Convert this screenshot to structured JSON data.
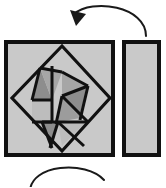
{
  "figure": {
    "canvas": {
      "width": 166,
      "height": 187
    },
    "colors": {
      "background": "#ffffff",
      "outline": "#111111",
      "fill_light": "#c9c9c9",
      "fill_medium": "#a8a8a8",
      "fill_dark": "#8d8d8d",
      "arrow": "#1a1a1a"
    }
  },
  "shapes": {
    "square_piece": {
      "name": "dissected-square",
      "label": "square",
      "x": 6,
      "y": 42,
      "width": 107,
      "height": 113,
      "fill": "#c9c9c9",
      "stroke": "#111111",
      "stroke_width": 4
    },
    "rectangle_piece": {
      "name": "plain-rectangle",
      "label": "rectangle",
      "x": 124,
      "y": 42,
      "width": 35,
      "height": 113,
      "fill": "#c9c9c9",
      "stroke": "#111111",
      "stroke_width": 4
    },
    "inner_diamond": {
      "label": "inscribed diamond",
      "points": "62,46 110,98 62,151 12,98",
      "fill": "#c9c9c9",
      "stroke": "#111111",
      "stroke_width": 3.2
    },
    "pieces": [
      {
        "id": "piece-1",
        "label": "dark triangle upper-left",
        "points": "40,68 52,100 32,100",
        "fill": "#8d8d8d"
      },
      {
        "id": "piece-2",
        "label": "medium triangle upper-left-inner",
        "points": "40,68 62,72 52,100",
        "fill": "#a6a6a6"
      },
      {
        "id": "piece-3",
        "label": "light parallelogram left",
        "points": "32,100 52,100 52,122 32,122",
        "fill": "#bdbdbd"
      },
      {
        "id": "piece-4",
        "label": "medium triangle top-center",
        "points": "62,72 88,86 62,96",
        "fill": "#a6a6a6"
      },
      {
        "id": "piece-5",
        "label": "dark triangle center",
        "points": "62,96 88,86 80,118",
        "fill": "#8d8d8d"
      },
      {
        "id": "piece-6",
        "label": "medium triangle center-lower",
        "points": "62,96 80,118 58,122",
        "fill": "#9c9c9c"
      },
      {
        "id": "piece-7",
        "label": "dark triangle lower-left",
        "points": "42,122 58,122 50,146",
        "fill": "#8d8d8d"
      },
      {
        "id": "piece-8",
        "label": "light triangle lower-right",
        "points": "58,122 84,124 62,146",
        "fill": "#bdbdbd"
      }
    ],
    "cut_lines": [
      {
        "id": "cut-1",
        "x1": 40,
        "y1": 68,
        "x2": 32,
        "y2": 100
      },
      {
        "id": "cut-2",
        "x1": 40,
        "y1": 68,
        "x2": 62,
        "y2": 72
      },
      {
        "id": "cut-3",
        "x1": 32,
        "y1": 100,
        "x2": 52,
        "y2": 100
      },
      {
        "id": "cut-4",
        "x1": 52,
        "y1": 100,
        "x2": 52,
        "y2": 66
      },
      {
        "id": "cut-5",
        "x1": 32,
        "y1": 122,
        "x2": 52,
        "y2": 122
      },
      {
        "id": "cut-6",
        "x1": 52,
        "y1": 122,
        "x2": 52,
        "y2": 100
      },
      {
        "id": "cut-7",
        "x1": 62,
        "y1": 72,
        "x2": 88,
        "y2": 86
      },
      {
        "id": "cut-8",
        "x1": 88,
        "y1": 86,
        "x2": 62,
        "y2": 96
      },
      {
        "id": "cut-9",
        "x1": 62,
        "y1": 96,
        "x2": 88,
        "y2": 122
      },
      {
        "id": "cut-10",
        "x1": 88,
        "y1": 86,
        "x2": 80,
        "y2": 120
      },
      {
        "id": "cut-11",
        "x1": 62,
        "y1": 96,
        "x2": 56,
        "y2": 124
      },
      {
        "id": "cut-12",
        "x1": 42,
        "y1": 122,
        "x2": 88,
        "y2": 122
      },
      {
        "id": "cut-13",
        "x1": 42,
        "y1": 122,
        "x2": 52,
        "y2": 148
      },
      {
        "id": "cut-14",
        "x1": 58,
        "y1": 122,
        "x2": 50,
        "y2": 148
      },
      {
        "id": "cut-15",
        "x1": 58,
        "y1": 122,
        "x2": 84,
        "y2": 146
      }
    ]
  },
  "arrows": {
    "top": {
      "name": "rotation-arrow-top",
      "label": "rotate left",
      "path": "M 146,36 C 146,6 92,-2 74,14",
      "head": "70,10 86,14 76,26",
      "stroke": "#1a1a1a",
      "stroke_width": 2
    },
    "bottom": {
      "name": "rotation-arrow-bottom",
      "label": "rotate",
      "path": "M 30,192 C 30,164 86,160 104,180",
      "stroke": "#1a1a1a",
      "stroke_width": 2
    }
  }
}
